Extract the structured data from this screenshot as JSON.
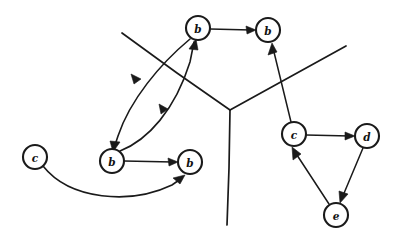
{
  "diagram": {
    "kind": "node-link-diagram",
    "background_color": "#ffffff",
    "ink_color": "#1a1a1a",
    "canvas": {
      "width": 399,
      "height": 234
    },
    "nodes": [
      {
        "id": "n1",
        "label": "b",
        "cx": 198,
        "cy": 28,
        "r": 12
      },
      {
        "id": "n2",
        "label": "b",
        "cx": 268,
        "cy": 30,
        "r": 12
      },
      {
        "id": "n3",
        "label": "b",
        "cx": 112,
        "cy": 161,
        "r": 12
      },
      {
        "id": "n4",
        "label": "b",
        "cx": 190,
        "cy": 162,
        "r": 12
      },
      {
        "id": "n5",
        "label": "c",
        "cx": 35,
        "cy": 157,
        "r": 12
      },
      {
        "id": "n6",
        "label": "c",
        "cx": 294,
        "cy": 134,
        "r": 12
      },
      {
        "id": "n7",
        "label": "d",
        "cx": 367,
        "cy": 136,
        "r": 12
      },
      {
        "id": "n8",
        "label": "e",
        "cx": 336,
        "cy": 215,
        "r": 12
      }
    ],
    "edges": [
      {
        "id": "e1",
        "from": "n1",
        "to": "n2",
        "style": "straight"
      },
      {
        "id": "e2",
        "from": "n3",
        "to": "n1",
        "style": "curve-right"
      },
      {
        "id": "e3",
        "from": "n1",
        "to": "n3",
        "style": "curve-left"
      },
      {
        "id": "e4",
        "from": "n3",
        "to": "n4",
        "style": "straight"
      },
      {
        "id": "e5",
        "from": "n5",
        "to": "n4",
        "style": "curve-below"
      },
      {
        "id": "e6",
        "from": "n6",
        "to": "n2",
        "style": "straight"
      },
      {
        "id": "e7",
        "from": "n6",
        "to": "n7",
        "style": "straight"
      },
      {
        "id": "e8",
        "from": "n7",
        "to": "n8",
        "style": "straight"
      },
      {
        "id": "e9",
        "from": "n8",
        "to": "n6",
        "style": "straight"
      }
    ],
    "partition": {
      "junction": {
        "x": 230,
        "y": 110
      },
      "branches": [
        {
          "id": "p-upper-left",
          "to": {
            "x": 122,
            "y": 33
          }
        },
        {
          "id": "p-upper-right",
          "to": {
            "x": 346,
            "y": 46
          }
        },
        {
          "id": "p-lower",
          "to": {
            "x": 227,
            "y": 225
          }
        }
      ]
    }
  }
}
